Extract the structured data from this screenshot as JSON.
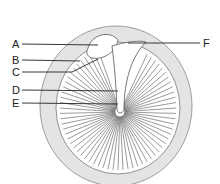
{
  "diagram": {
    "labels": [
      {
        "id": "A",
        "text": "A",
        "x": 12,
        "y": 40
      },
      {
        "id": "B",
        "text": "B",
        "x": 12,
        "y": 56
      },
      {
        "id": "C",
        "text": "C",
        "x": 12,
        "y": 68
      },
      {
        "id": "D",
        "text": "D",
        "x": 12,
        "y": 86
      },
      {
        "id": "E",
        "text": "E",
        "x": 12,
        "y": 99
      },
      {
        "id": "F",
        "text": "F",
        "x": 203,
        "y": 39
      }
    ],
    "colors": {
      "outer_ring": "#e4e4e4",
      "membrane": "#ffffff",
      "lines": "#333333"
    }
  }
}
